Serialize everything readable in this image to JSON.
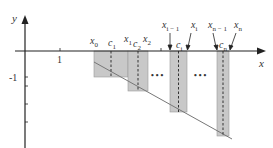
{
  "diagram": {
    "colors": {
      "axis": "#222222",
      "rect_fill": "#c8c8c8",
      "rect_stroke": "#9a9a9a",
      "line": "#777777",
      "dash": "#333333"
    },
    "axes": {
      "x_label": "x",
      "y_label": "y",
      "x_tick_label": "1",
      "y_tick_label": "-1"
    },
    "points": {
      "x0": {
        "base": "x",
        "sub": "0"
      },
      "c1": {
        "base": "c",
        "sub": "1"
      },
      "x1": {
        "base": "x",
        "sub": "1"
      },
      "c2": {
        "base": "c",
        "sub": "2"
      },
      "x2": {
        "base": "x",
        "sub": "2"
      },
      "xi_minus_1": {
        "base": "x",
        "sub": "i − 1"
      },
      "ci": {
        "base": "c",
        "sub": "i"
      },
      "xi": {
        "base": "x",
        "sub": "i"
      },
      "xn_minus_1": {
        "base": "x",
        "sub": "n − 1"
      },
      "cn": {
        "base": "c",
        "sub": "n"
      },
      "xn": {
        "base": "x",
        "sub": "n"
      }
    },
    "ellipsis_1": "• • •",
    "ellipsis_2": "• • •"
  }
}
